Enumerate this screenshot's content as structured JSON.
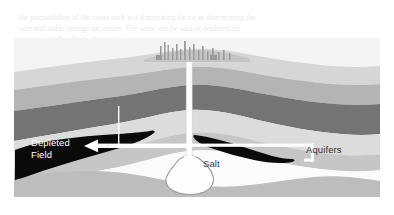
{
  "figure": {
    "background_color": "#ffffff",
    "border_color": "#cfcfcf"
  },
  "ghost_text": {
    "line1": "the permeability of the cover rock is a dominating factor in determining the",
    "line2": "safe and stable storage necessary. The same can be said of depleted oil",
    "line3": "or gas field. Finally, in the case of",
    "line4": "formations in water-bearing"
  },
  "labels": {
    "depleted_field_line1": "Depleted",
    "depleted_field_line2": "Field",
    "salt": "Salt",
    "aquifers": "Aquifers"
  },
  "icons": {
    "surface_facility": "industrial-plant-icon",
    "wellbore": "well-pipe-icon",
    "injection_arrow": "left-arrow-icon",
    "aquifer_pointer": "pointer-line-icon",
    "salt_cavern": "cavern-icon"
  },
  "strata": {
    "sky_color": "#f4f4f4",
    "surface_color": "#d8d8d8",
    "layer_light": "#e3e3e3",
    "layer_midlight": "#cfcfcf",
    "layer_mid": "#b8b8b8",
    "layer_dark": "#8e8e8e",
    "layer_darker": "#707070",
    "reservoir_color": "#0a0a0a",
    "cavern_fill": "#fdfdfd",
    "basement_color": "#bdbdbd",
    "annotation_color": "#ffffff"
  },
  "geology": {
    "layer_count": 8,
    "reservoirs": [
      {
        "name": "depleted-field-left",
        "side": "left",
        "fill": "#0a0a0a"
      },
      {
        "name": "oil-lens-right",
        "side": "right",
        "fill": "#0a0a0a"
      }
    ],
    "cavern": {
      "name": "salt-cavern",
      "depth_label": "Salt"
    }
  }
}
